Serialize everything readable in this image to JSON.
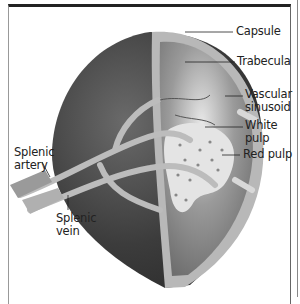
{
  "figure": {
    "labels": {
      "capsule": "Capsule",
      "trabecula": "Trabecula",
      "vascular_sinusoid_1": "Vascular",
      "vascular_sinusoid_2": "sinusoid",
      "white_pulp_1": "White",
      "white_pulp_2": "pulp",
      "red_pulp": "Red pulp",
      "splenic_artery_1": "Splenic",
      "splenic_artery_2": "artery",
      "splenic_vein_1": "Splenic",
      "splenic_vein_2": "vein"
    }
  }
}
